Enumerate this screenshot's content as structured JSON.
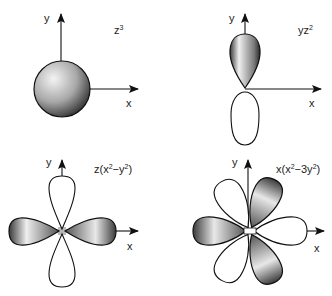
{
  "figure": {
    "colors": {
      "stroke": "#111111",
      "lobe_fill_light": "#f2f2f2",
      "lobe_fill_dark": "#3a3a3a",
      "background": "#ffffff"
    },
    "panels": [
      {
        "id": "z3",
        "orbital_label": "z",
        "orbital_sup": "3",
        "axis_y": "y",
        "axis_x": "x"
      },
      {
        "id": "yz2",
        "orbital_label": "yz",
        "orbital_sup": "2",
        "axis_y": "y",
        "axis_x": "x"
      },
      {
        "id": "zx2-y2",
        "orbital_pre": "z(x",
        "orbital_sup1": "2",
        "orbital_mid": "−y",
        "orbital_sup2": "2",
        "orbital_post": ")",
        "axis_y": "y",
        "axis_x": "x"
      },
      {
        "id": "xx2-3y2",
        "orbital_pre": "x(x",
        "orbital_sup1": "2",
        "orbital_mid": "−3y",
        "orbital_sup2": "2",
        "orbital_post": ")",
        "axis_y": "y",
        "axis_x": "x"
      }
    ]
  }
}
